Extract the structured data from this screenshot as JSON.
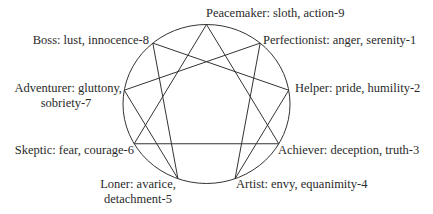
{
  "center_label": "",
  "types": [
    {
      "number": 9,
      "name": "Peacemaker",
      "passion": "sloth",
      "virtue": "action",
      "label_line1": "Peacemaker: sloth, action-9",
      "label_line2": ""
    },
    {
      "number": 1,
      "name": "Perfectionist",
      "passion": "anger",
      "virtue": "serenity",
      "label_line1": "Perfectionist: anger, serenity-1",
      "label_line2": ""
    },
    {
      "number": 2,
      "name": "Helper",
      "passion": "pride",
      "virtue": "humility",
      "label_line1": "Helper: pride, humility-2",
      "label_line2": ""
    },
    {
      "number": 3,
      "name": "Achiever",
      "passion": "deception",
      "virtue": "truth",
      "label_line1": "Achiever: deception, truth-3",
      "label_line2": ""
    },
    {
      "number": 4,
      "name": "Artist",
      "passion": "envy",
      "virtue": "equanimity",
      "label_line1": "Artist: envy, equanimity-4",
      "label_line2": ""
    },
    {
      "number": 5,
      "name": "Loner",
      "passion": "avarice",
      "virtue": "detachment",
      "label_line1": "Loner: avarice,",
      "label_line2": "detachment-5"
    },
    {
      "number": 6,
      "name": "Skeptic",
      "passion": "fear",
      "virtue": "courage",
      "label_line1": "Skeptic: fear, courage-6",
      "label_line2": ""
    },
    {
      "number": 7,
      "name": "Adventurer",
      "passion": "gluttony",
      "virtue": "sobriety",
      "label_line1": "Adventurer: gluttony,",
      "label_line2": "sobriety-7"
    },
    {
      "number": 8,
      "name": "Boss",
      "passion": "lust",
      "virtue": "innocence",
      "label_line1": "Boss: lust, innocence-8",
      "label_line2": ""
    }
  ],
  "connections": {
    "triangle": [
      9,
      3,
      6,
      9
    ],
    "hexad": [
      1,
      4,
      2,
      8,
      5,
      7,
      1
    ]
  },
  "colors": {
    "line": "#333333",
    "text": "#2a2a2a",
    "background": "#ffffff"
  }
}
